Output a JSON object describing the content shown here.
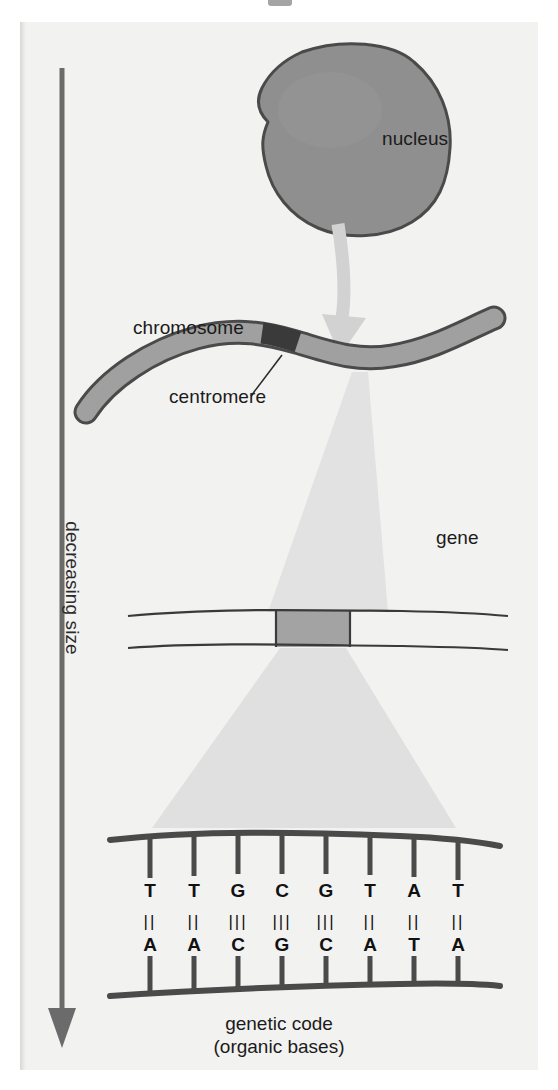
{
  "figure": {
    "title_fragment": "",
    "caption_line1": "genetic code",
    "caption_line2": "(organic bases)",
    "axis_label": "decreasing size",
    "background_color": "#f2f2f1",
    "ink_color": "#3a3a3a",
    "highlight_color": "#9a9a9a",
    "cone_color": "#dedede"
  },
  "labels": {
    "nucleus": "nucleus",
    "chromosome": "chromosome",
    "centromere": "centromere",
    "gene": "gene"
  },
  "dna": {
    "top_strand": [
      "T",
      "T",
      "G",
      "C",
      "G",
      "T",
      "A",
      "T"
    ],
    "bottom_strand": [
      "A",
      "A",
      "C",
      "G",
      "C",
      "A",
      "T",
      "A"
    ],
    "hydrogen_bonds": [
      2,
      2,
      3,
      3,
      3,
      2,
      2,
      2
    ],
    "bond_glyphs": [
      "||",
      "||",
      "|||",
      "|||",
      "|||",
      "||",
      "||",
      "||"
    ],
    "pair_count": 8
  },
  "structures": {
    "nucleus_fill": "#8f8f8f",
    "nucleus_stroke": "#4a4a4a",
    "chromosome_fill": "#a0a0a0",
    "chromosome_stroke": "#4a4a4a",
    "centromere_fill": "#3f3f3f",
    "gene_band_fill": "#a3a3a3",
    "strand_stroke": "#3a3a3a"
  }
}
